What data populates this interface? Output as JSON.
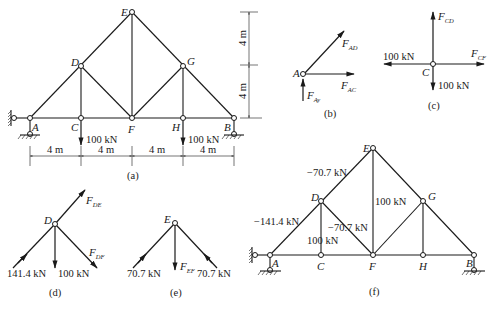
{
  "figure": {
    "panels": {
      "a": {
        "caption": "(a)",
        "nodes": {
          "A": "A",
          "C": "C",
          "D": "D",
          "E": "E",
          "F": "F",
          "G": "G",
          "H": "H",
          "B": "B"
        },
        "loads": {
          "C": "100 kN",
          "H": "100 kN"
        },
        "horizontal_dims": [
          "4 m",
          "4 m",
          "4 m",
          "4 m"
        ],
        "vertical_dims": [
          "4 m",
          "4 m"
        ]
      },
      "b": {
        "caption": "(b)",
        "node": "A",
        "forces": {
          "AD": {
            "main": "F",
            "sub": "AD"
          },
          "AC": {
            "main": "F",
            "sub": "AC"
          },
          "Ay": {
            "main": "F",
            "sub": "Ay"
          }
        }
      },
      "c": {
        "caption": "(c)",
        "node": "C",
        "forces": {
          "CD": {
            "main": "F",
            "sub": "CD"
          },
          "CF": {
            "main": "F",
            "sub": "CF"
          }
        },
        "left_load": "100 kN",
        "down_load": "100 kN"
      },
      "d": {
        "caption": "(d)",
        "node": "D",
        "forces": {
          "DE": {
            "main": "F",
            "sub": "DE"
          },
          "DF": {
            "main": "F",
            "sub": "DF"
          }
        },
        "left_load": "141.4 kN",
        "down_load": "100 kN"
      },
      "e": {
        "caption": "(e)",
        "node": "E",
        "forces": {
          "EF": {
            "main": "F",
            "sub": "EF"
          }
        },
        "left_load": "70.7 kN",
        "right_load": "70.7 kN"
      },
      "f": {
        "caption": "(f)",
        "nodes": {
          "A": "A",
          "C": "C",
          "D": "D",
          "E": "E",
          "F": "F",
          "G": "G",
          "H": "H",
          "B": "B"
        },
        "member_forces": {
          "DE": "−70.7 kN",
          "AD": "−141.4 kN",
          "DF": "−70.7 kN",
          "CD": "100 kN",
          "EF": "100 kN"
        }
      }
    }
  }
}
